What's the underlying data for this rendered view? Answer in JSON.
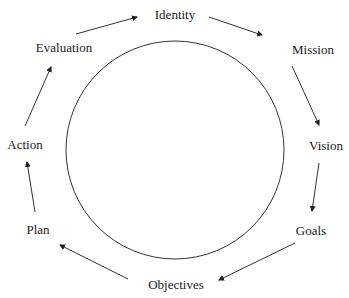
{
  "diagram": {
    "type": "cycle",
    "nodes": [
      {
        "label": "Identity",
        "x": 175,
        "y": 15
      },
      {
        "label": "Mission",
        "x": 313,
        "y": 50
      },
      {
        "label": "Vision",
        "x": 326,
        "y": 146
      },
      {
        "label": "Goals",
        "x": 311,
        "y": 231
      },
      {
        "label": "Objectives",
        "x": 176,
        "y": 285
      },
      {
        "label": "Plan",
        "x": 38,
        "y": 230
      },
      {
        "label": "Action",
        "x": 25,
        "y": 145
      },
      {
        "label": "Evaluation",
        "x": 64,
        "y": 48
      }
    ],
    "edges": [
      {
        "from": "Identity",
        "to": "Mission"
      },
      {
        "from": "Mission",
        "to": "Vision"
      },
      {
        "from": "Vision",
        "to": "Goals"
      },
      {
        "from": "Goals",
        "to": "Objectives"
      },
      {
        "from": "Objectives",
        "to": "Plan"
      },
      {
        "from": "Plan",
        "to": "Action"
      },
      {
        "from": "Action",
        "to": "Evaluation"
      },
      {
        "from": "Evaluation",
        "to": "Identity"
      }
    ],
    "center_shape": "circle"
  }
}
